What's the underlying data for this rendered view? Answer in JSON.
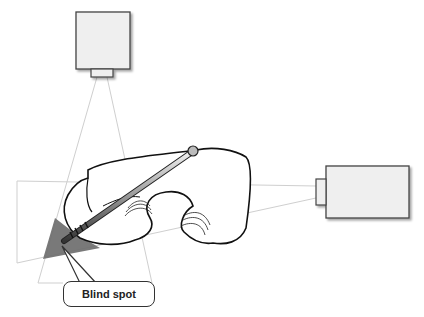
{
  "figure": {
    "label": "Blind spot",
    "colors": {
      "camera_fill": "#efefef",
      "camera_stroke": "#444444",
      "beam_line": "#c8c8c8",
      "blind_spot": "#6e6e6e",
      "bone_outline": "#111111"
    },
    "elements": [
      {
        "name": "top-camera",
        "box": [
          76,
          12,
          54,
          57
        ],
        "lens": [
          91,
          69,
          22,
          8
        ]
      },
      {
        "name": "side-camera",
        "box": [
          326,
          166,
          83,
          52
        ],
        "lens": [
          316,
          179,
          10,
          26
        ]
      }
    ]
  }
}
